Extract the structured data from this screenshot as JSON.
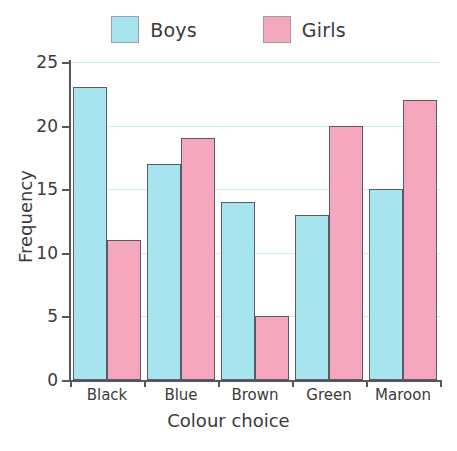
{
  "chart_data": {
    "type": "bar",
    "title": "",
    "xlabel": "Colour choice",
    "ylabel": "Frequency",
    "categories": [
      "Black",
      "Blue",
      "Brown",
      "Green",
      "Maroon"
    ],
    "series": [
      {
        "name": "Boys",
        "values": [
          23,
          17,
          14,
          13,
          15
        ],
        "color": "#a8e4f0"
      },
      {
        "name": "Girls",
        "values": [
          11,
          19,
          5,
          20,
          22
        ],
        "color": "#f4a7bd"
      }
    ],
    "ylim": [
      0,
      25
    ],
    "ytick_values": [
      0,
      5,
      10,
      15,
      20,
      25
    ],
    "ytick_labels": [
      "0",
      "5",
      "10",
      "15",
      "20",
      "25"
    ],
    "grid": true,
    "grid_color": "#cdeef5",
    "legend_position": "top-center",
    "axis_color": "#54575b",
    "bar_edge_color": "#5a5a66",
    "background": "#ffffff"
  },
  "legend": {
    "entries": [
      {
        "label": "Boys",
        "color": "#a8e4f0"
      },
      {
        "label": "Girls",
        "color": "#f4a7bd"
      }
    ]
  }
}
